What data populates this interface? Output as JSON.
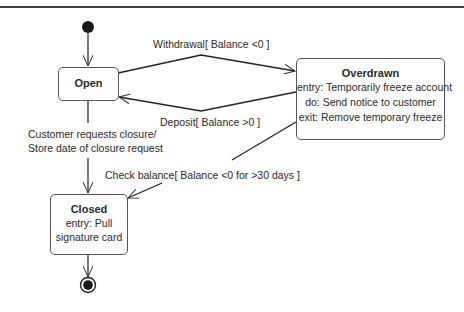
{
  "diagram": {
    "type": "uml-state-machine",
    "states": [
      {
        "id": "open",
        "name": "Open",
        "activities": []
      },
      {
        "id": "overdrawn",
        "name": "Overdrawn",
        "activities": [
          "entry: Temporarily freeze account",
          "do: Send notice to customer",
          "exit: Remove temporary freeze"
        ]
      },
      {
        "id": "closed",
        "name": "Closed",
        "activities": [
          "entry: Pull",
          "signature card"
        ]
      }
    ],
    "pseudostates": [
      {
        "id": "initial",
        "kind": "initial"
      },
      {
        "id": "final",
        "kind": "final"
      }
    ],
    "transitions": [
      {
        "from": "initial",
        "to": "open",
        "label": ""
      },
      {
        "from": "open",
        "to": "overdrawn",
        "label": "Withdrawal[ Balance <0 ]"
      },
      {
        "from": "overdrawn",
        "to": "open",
        "label": "Deposit[ Balance >0 ]"
      },
      {
        "from": "open",
        "to": "closed",
        "label_lines": [
          "Customer requests closure/",
          "Store date of closure request"
        ]
      },
      {
        "from": "overdrawn",
        "to": "closed",
        "label": "Check balance[ Balance <0 for >30 days ]"
      },
      {
        "from": "closed",
        "to": "final",
        "label": ""
      }
    ]
  }
}
